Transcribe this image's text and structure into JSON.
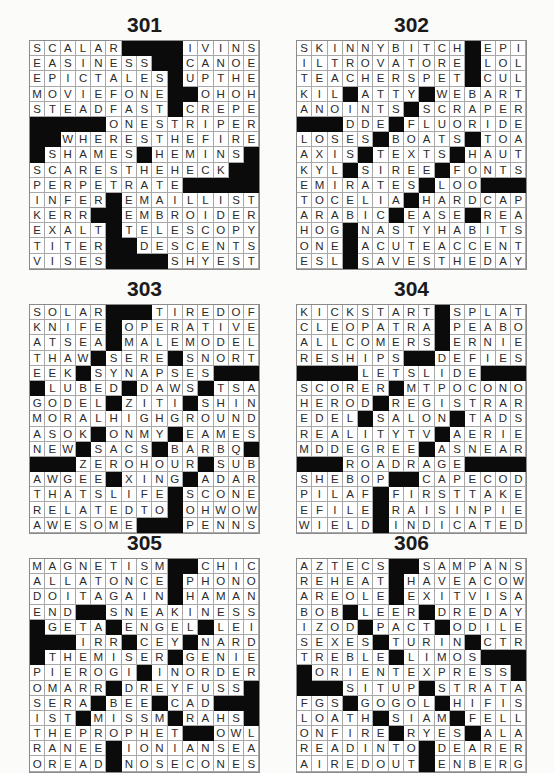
{
  "page": {
    "puzzles": [
      {
        "number": "301",
        "rows": [
          "SCALAR####IVINS",
          "EASINESS##CANOE",
          "EPICTALES#UPTHE",
          "MOVIEFONE##OHOH",
          "STEADFAST#CREPE",
          "#####ONESTRIPER",
          "##WHERESTHEFIRE",
          "#SHAMES#HEMINS#",
          "SCARESTHEHECK##",
          "PERPETRATE#####",
          "INFER#EMAILLIST",
          "KERR##EMBROIDER",
          "EXALT#TELESCOPY",
          "TITER##DESCENTS",
          "VISES####SHYEST"
        ]
      },
      {
        "number": "302",
        "rows": [
          "SKINNYBITCH#EPI",
          "ILTROVATORE#LOL",
          "TEACHERSPET#CUL",
          "KIL#ATTY#WEBART",
          "ANOINTS#SCRAPER",
          "###DDE#FLUORIDE",
          "LOSES#BOATS#TOA",
          "AXIS#TEXTS#HAUT",
          "KYL#SIREE#FONTS",
          "EMIRATES#LOO###",
          "TOCELIA#HARDCAP",
          "ARABIC#EASE#REA",
          "HOG#NASTYHABITS",
          "ONE#ACUTEACCENT",
          "ESL#SAVESTHEDAY"
        ]
      },
      {
        "number": "303",
        "rows": [
          "SOLAR###TIREDOF",
          "KNIFE#OPERATIVE",
          "ATSEA#MALEMODEL",
          "THAW#SERE#SNORT",
          "EEK#SYNAPSES###",
          "#LUBED#DAWS#TSA",
          "GODEL#ZITI#SHIN",
          "MORALHIGHGROUND",
          "ASOK#ONMY#EAMES",
          "NEW#SACS#BARBQ#",
          "###ZEROHOUR#SUB",
          "AWGEE#XING#ADAR",
          "THATSLIFE#SCONE",
          "RELATEDTO#OHWOW",
          "AWESOME###PENNS"
        ]
      },
      {
        "number": "304",
        "rows": [
          "KICKSTART#SPLAT",
          "CLEOPATRA#PEABO",
          "ALLCOMERS#ERNIE",
          "RESHIPS##DEFIES",
          "####LETSLIDE###",
          "SCORER#MTPOCONO",
          "HEROD#REGISTRAR",
          "EDEL#SALON#TADS",
          "REALITYTV#AERIE",
          "MDDEGREE#ASNEAR",
          "###ROADRAGE####",
          "SHEBOP##CAPECOD",
          "PILAF#FIRSTTAKE",
          "EFILE#RAISINPIE",
          "WIELD#INDICATED"
        ]
      },
      {
        "number": "305",
        "rows": [
          "MAGNETISM##CHIC",
          "ALLATONCE#PHONO",
          "DOITAGAIN#HAMAN",
          "END##SNEAKINESS",
          "#GETA#ENGEL#LEI",
          "###IRR#CEY#NARD",
          "#THEMISER#GENIE",
          "PIEROGI#INORDER",
          "OMARR#DREYFUSS#",
          "SERA#BEE#CAD###",
          "IST#MISSM#RAHS#",
          "THEPROPHET##OWL",
          "RANEE#IONIANSEA",
          "OREAD#NOSECONES"
        ]
      },
      {
        "number": "306",
        "rows": [
          "AZTECS##SAMPANS",
          "REHEAT#HAVEACOW",
          "AREOLE#EXITVISA",
          "BOB#LEER#DREDAY",
          "IZOD#PACT#ODILE",
          "SEXES#TURIN#CTR",
          "TREBLE#LIMOS###",
          "#ORIENTEXPRESS#",
          "###SITUP#STRATA",
          "FGS#GOGOL#HIFIS",
          "LOATH#SIAM#FELL",
          "ONFIRE#RYES#ALA",
          "READINTO#DEARER",
          "AIREDOUT#ENBERG"
        ]
      }
    ]
  },
  "colors": {
    "black_square": "#0b0b0b",
    "cell_border": "#a8a8a8",
    "text": "#2a2a2a"
  }
}
